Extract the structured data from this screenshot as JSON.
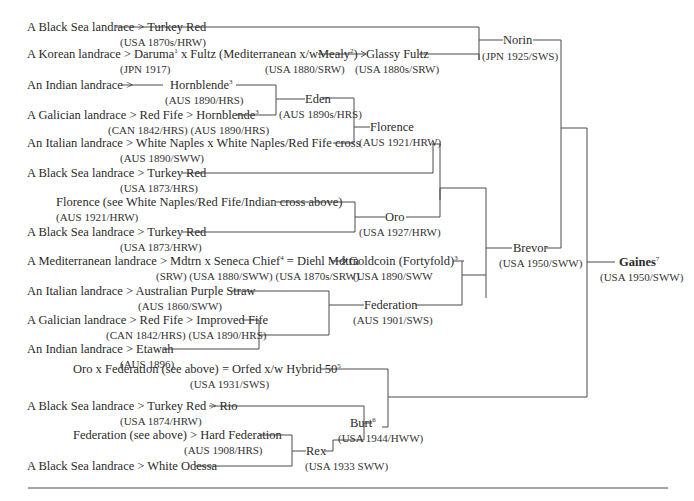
{
  "diagram": {
    "type": "pedigree-tree",
    "root": {
      "name": "Gaines",
      "note": "7",
      "info": "(USA 1950/SWW)"
    },
    "rows": [
      {
        "id": "r1",
        "text": "A Black Sea landrace > Turkey Red",
        "sub": "(USA 1870s/HRW)"
      },
      {
        "id": "r2",
        "text_a": "A Korean landrace > Daruma",
        "note_a": "1",
        "text_b": " x Fultz (Mediterranean x/wMealy",
        "note_b": "2",
        "text_c": ")",
        "sub_a": "(JPN 1917)",
        "sub_b": "(USA 1880/SRW)"
      },
      {
        "id": "r2b",
        "text": "Glassy Fultz",
        "sub": "(USA 1880s/SRW)"
      },
      {
        "id": "r3",
        "text_a": "An Indian landrace >",
        "text_b": "Hornblende",
        "note": "3",
        "sub": "(AUS 1890/HRS)"
      },
      {
        "id": "r4",
        "text": "A Galician landrace > Red Fife > Hornblende",
        "note": "3",
        "sub": "(CAN 1842/HRS)  (AUS 1890/HRS)"
      },
      {
        "id": "r5",
        "text": "An Italian landrace > White Naples x White Naples/Red Fife cross",
        "sub": "(AUS 1890/SWW)"
      },
      {
        "id": "r6",
        "text": "A Black Sea landrace > Turkey Red",
        "sub": "(USA 1873/HRS)"
      },
      {
        "id": "r7",
        "text": "Florence (see White Naples/Red Fife/Indian cross above)",
        "sub": "(AUS 1921/HRW)"
      },
      {
        "id": "r8",
        "text": "A Black Sea landrace > Turkey Red",
        "sub": "(USA 1873/HRW)"
      },
      {
        "id": "r9",
        "text_a": "A Mediterranean landrace > Mdtrn x Seneca Chief",
        "note": "4",
        "text_b": " = Diehl Mdtrn",
        "sub": "(SRW)   (USA 1880/SWW) (USA 1870s/SRW)"
      },
      {
        "id": "r9b",
        "text": "Goldcoin (Fortyfold)",
        "note": "3",
        "sub": "(USA 1890/SWW"
      },
      {
        "id": "r10",
        "text": "An Italian landrace > Australian Purple Straw",
        "sub": "(AUS 1860/SWW)"
      },
      {
        "id": "r11",
        "text": "A Galician landrace > Red Fife > Improved Fife",
        "sub": "(CAN 1842/HRS) (USA 1890/HRS)"
      },
      {
        "id": "r12",
        "text": "An Indian landrace > Etawah",
        "sub": "(AUS 1896)"
      },
      {
        "id": "r13",
        "text": "Oro x Federation (see above) = Orfed  x/w Hybrid 50",
        "note": "5",
        "sub": "(USA 1931/SWS)"
      },
      {
        "id": "r14",
        "text": "A Black Sea landrace > Turkey Red > Rio",
        "sub": "(USA 1874/HRW)"
      },
      {
        "id": "r15",
        "text": "Federation (see above) > Hard Federation",
        "sub": "(AUS 1908/HRS)"
      },
      {
        "id": "r16",
        "text": "A Black Sea landrace > White Odessa"
      }
    ],
    "nodes": {
      "norin": {
        "name": "Norin",
        "info": "(JPN 1925/SWS)"
      },
      "eden": {
        "name": "Eden",
        "info": "(AUS 1890s/HRS)"
      },
      "florence": {
        "name": "Florence",
        "info": "(AUS 1921/HRW)"
      },
      "oro": {
        "name": "Oro",
        "info": "(USA 1927/HRW)"
      },
      "brevor": {
        "name": "Brevor",
        "info": "(USA 1950/SWW)"
      },
      "federation": {
        "name": "Federation",
        "info": "(AUS 1901/SWS)"
      },
      "burt": {
        "name": "Burt",
        "note": "6",
        "info": "(USA 1944/HWW)"
      },
      "rex": {
        "name": "Rex",
        "info": "(USA 1933 SWW)"
      }
    }
  }
}
